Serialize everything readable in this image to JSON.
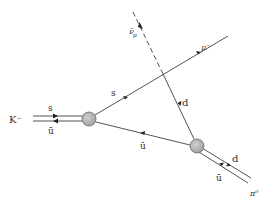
{
  "diagram": {
    "type": "feynman",
    "title": "",
    "process": "K- -> pi0 mu- anti-nu_mu",
    "vertices": [
      {
        "id": "kaon-vertex",
        "x": 89,
        "y": 119,
        "r": 7
      },
      {
        "id": "pion-vertex",
        "x": 197,
        "y": 146,
        "r": 7
      }
    ],
    "labels": {
      "kaon": "K⁻",
      "kaon_s": "s",
      "kaon_ubar": "ū",
      "s_quark": "s",
      "d_quark": "d",
      "ubar_internal": "ū",
      "muon": "μ⁻",
      "antineutrino": "ν̄",
      "antineutrino_sub": "μ",
      "pion_d": "d",
      "pion_ubar": "ū",
      "pion": "π⁰"
    },
    "colors": {
      "line": "#555555",
      "blob_fill": "#b8b8b8",
      "blob_stroke": "#666666",
      "text": "#333333"
    }
  }
}
